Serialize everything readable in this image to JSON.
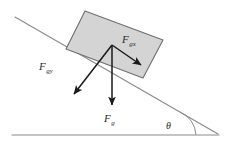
{
  "diagram": {
    "type": "free-body-diagram",
    "background_color": "#ffffff",
    "surface": {
      "incline_line": {
        "name": "incline-surface",
        "x1": 15,
        "y1": 17,
        "x2": 218,
        "y2": 134,
        "color": "#8a8a8a",
        "width": 1.1
      },
      "ground_line": {
        "name": "ground-surface",
        "x1": 12,
        "y1": 135,
        "x2": 219,
        "y2": 135,
        "color": "#8a8a8a",
        "width": 1.1
      }
    },
    "block": {
      "name": "block",
      "fill": "#d4d4d4",
      "stroke": "#6e6e6e",
      "stroke_width": 1.1,
      "points": "85,11 163,40 143,78 66,49"
    },
    "origin": {
      "x": 112,
      "y": 45
    },
    "vectors": [
      {
        "id": "fgx",
        "label": "F",
        "subscript": "gx",
        "description": "gravity component parallel to incline",
        "x1": 112,
        "y1": 45,
        "x2": 143,
        "y2": 67,
        "color": "#1a1a1a",
        "label_x": 122,
        "label_y": 42
      },
      {
        "id": "fgy",
        "label": "F",
        "subscript": "gy",
        "description": "gravity component perpendicular to incline",
        "x1": 112,
        "y1": 45,
        "x2": 72,
        "y2": 96,
        "color": "#1a1a1a",
        "label_x": 40,
        "label_y": 70
      },
      {
        "id": "fg",
        "label": "F",
        "subscript": "g",
        "description": "total gravitational force, vertical downward",
        "x1": 112,
        "y1": 45,
        "x2": 112,
        "y2": 107,
        "color": "#1a1a1a",
        "label_x": 104,
        "label_y": 122
      }
    ],
    "angle": {
      "id": "theta",
      "symbol": "θ",
      "description": "incline angle between slope and horizontal ground",
      "label_x": 166,
      "label_y": 128,
      "arc_color": "#8a8a8a",
      "arc_path": "M 196 135 A 26 26 0 0 0 180 112"
    }
  }
}
